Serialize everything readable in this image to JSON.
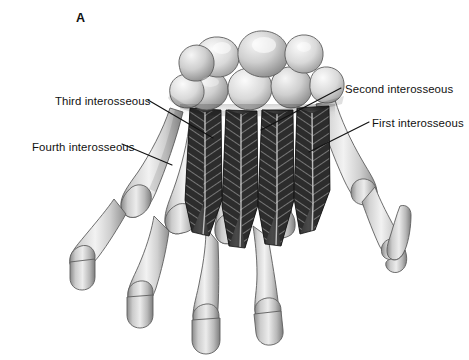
{
  "figure": {
    "panel_letter": "A",
    "background_color": "#ffffff",
    "ink_color": "#111111",
    "view": "dorsal"
  },
  "labels": {
    "third": "Third interosseous",
    "fourth": "Fourth interosseous",
    "second": "Second interosseous",
    "first": "First interosseous"
  },
  "leaders": {
    "third": "M148,100 L213,138",
    "fourth": "M122,144 L172,165",
    "second": "M341,88 L261,130",
    "first": "M369,122 L309,152"
  },
  "anatomy": {
    "carpal_row_label": "carpal-bones",
    "metacarpal_count": 5,
    "interosseous_muscle_count": 4,
    "phalanx_rows": [
      "proximal",
      "middle"
    ],
    "thumb_side": "right"
  }
}
